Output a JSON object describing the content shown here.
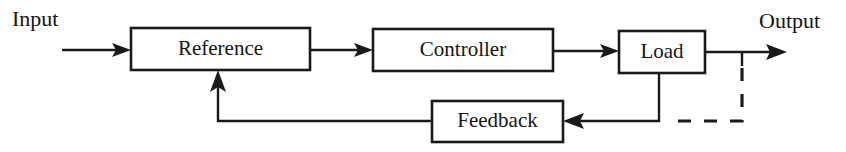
{
  "diagram": {
    "background_color": "#ffffff",
    "line_color": "#1a1a1a",
    "text_color": "#141414",
    "labels": {
      "input": "Input",
      "output": "Output"
    },
    "blocks": [
      {
        "id": "reference",
        "label": "Reference"
      },
      {
        "id": "controller",
        "label": "Controller"
      },
      {
        "id": "load",
        "label": "Load"
      },
      {
        "id": "feedback",
        "label": "Feedback"
      }
    ],
    "connections": [
      {
        "id": "input-to-reference",
        "style": "solid",
        "arrow": "true"
      },
      {
        "id": "reference-to-controller",
        "style": "solid",
        "arrow": "true"
      },
      {
        "id": "controller-to-load",
        "style": "solid",
        "arrow": "true"
      },
      {
        "id": "load-to-output",
        "style": "solid",
        "arrow": "true"
      },
      {
        "id": "load-tap-to-feedback",
        "style": "solid",
        "arrow": "true"
      },
      {
        "id": "output-tap-dashed",
        "style": "dashed",
        "arrow": "false"
      },
      {
        "id": "feedback-to-reference",
        "style": "solid",
        "arrow": "true"
      }
    ]
  }
}
